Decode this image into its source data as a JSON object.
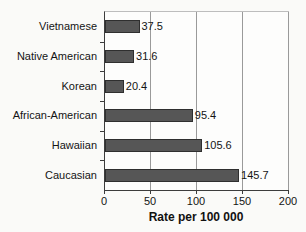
{
  "chart_data": {
    "type": "bar",
    "orientation": "horizontal",
    "categories": [
      "Vietnamese",
      "Native American",
      "Korean",
      "African-American",
      "Hawaiian",
      "Caucasian"
    ],
    "values": [
      37.5,
      31.6,
      20.4,
      95.4,
      105.6,
      145.7
    ],
    "value_labels": [
      "37.5",
      "31.6",
      "20.4",
      "95.4",
      "105.6",
      "145.7"
    ],
    "title": "",
    "xlabel": "Rate per 100 000",
    "ylabel": "",
    "xlim": [
      0,
      200
    ],
    "xticks": [
      0,
      50,
      100,
      150,
      200
    ],
    "grid": true,
    "legend_position": "none",
    "bar_color": "#565656",
    "bar_border_color": "#2f2f2f",
    "gridline_color": "#9a9a9a",
    "axis_color": "#3c3c3c",
    "text_color": "#141414",
    "background_color": "#fafaf8"
  }
}
